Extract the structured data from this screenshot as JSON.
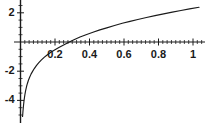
{
  "chart_data": {
    "type": "line",
    "title": "",
    "subtitle": "",
    "xlabel": "",
    "ylabel": "",
    "xlim": [
      -0.02,
      1.07
    ],
    "ylim": [
      -5.2,
      3.0
    ],
    "grid": false,
    "legend": null,
    "axis_style": "crossed-at-origin",
    "xticks": [
      0.2,
      0.4,
      0.6,
      0.8,
      1
    ],
    "xtick_labels": [
      "0.2",
      "0.4",
      "0.6",
      "0.8",
      "1"
    ],
    "yticks": [
      2,
      -2,
      -4
    ],
    "ytick_labels": [
      "2",
      "-2",
      "-4"
    ],
    "minor_ticks": true,
    "line_color": "#1a1a1a",
    "axis_color": "#1a1a1a",
    "zero_crossing_x": 0.28,
    "series": [
      {
        "name": "curve",
        "x": [
          0.012,
          0.014,
          0.016,
          0.018,
          0.02,
          0.023,
          0.026,
          0.03,
          0.035,
          0.04,
          0.046,
          0.053,
          0.061,
          0.07,
          0.08,
          0.092,
          0.105,
          0.12,
          0.137,
          0.156,
          0.178,
          0.2,
          0.225,
          0.25,
          0.28,
          0.31,
          0.345,
          0.38,
          0.42,
          0.46,
          0.5,
          0.545,
          0.59,
          0.635,
          0.68,
          0.73,
          0.78,
          0.83,
          0.88,
          0.93,
          0.98,
          1.035
        ],
        "y": [
          -5.1,
          -4.8,
          -4.52,
          -4.28,
          -4.07,
          -3.8,
          -3.57,
          -3.31,
          -3.05,
          -2.84,
          -2.62,
          -2.41,
          -2.2,
          -2.01,
          -1.82,
          -1.62,
          -1.43,
          -1.24,
          -1.05,
          -0.87,
          -0.68,
          -0.53,
          -0.36,
          -0.2,
          -0.01,
          0.16,
          0.34,
          0.5,
          0.67,
          0.83,
          0.97,
          1.13,
          1.28,
          1.41,
          1.54,
          1.68,
          1.81,
          1.93,
          2.05,
          2.16,
          2.27,
          2.38
        ]
      }
    ]
  },
  "axes": {
    "x_axis_name": "horizontal-axis",
    "y_axis_name": "vertical-axis"
  }
}
